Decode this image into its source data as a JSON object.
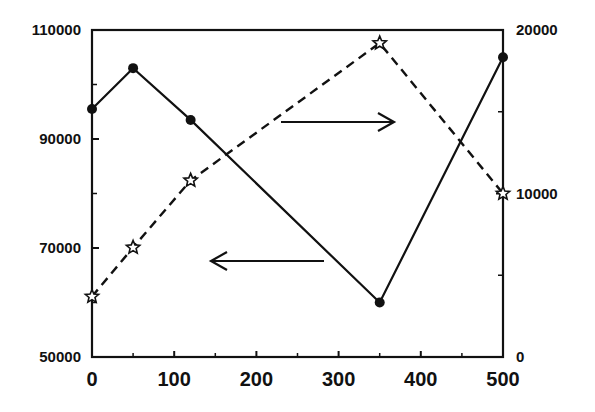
{
  "chart_data": {
    "type": "line",
    "title": "",
    "xlabel": "",
    "ylabel": "",
    "y2label": "",
    "xlim": [
      0,
      500
    ],
    "ylim": [
      50000,
      110000
    ],
    "y2lim": [
      0,
      20000
    ],
    "x_ticks": [
      0,
      100,
      200,
      300,
      400,
      500
    ],
    "y_ticks": [
      50000,
      70000,
      90000,
      110000
    ],
    "y2_ticks": [
      0,
      10000,
      20000
    ],
    "x_tick_labels": [
      "0",
      "100",
      "200",
      "300",
      "400",
      "500"
    ],
    "y_tick_labels": [
      "50000",
      "70000",
      "90000",
      "110000"
    ],
    "y2_tick_labels": [
      "0",
      "10000",
      "20000"
    ],
    "grid": false,
    "legend": null,
    "series": [
      {
        "name": "left-axis series (solid, filled circles)",
        "axis": "left",
        "line_style": "solid",
        "marker": "filled-circle",
        "x": [
          0,
          50,
          120,
          350,
          500
        ],
        "values": [
          95500,
          103000,
          93500,
          60000,
          105000
        ]
      },
      {
        "name": "right-axis series (dashed, open stars)",
        "axis": "right",
        "line_style": "dashed",
        "marker": "open-star",
        "x": [
          0,
          50,
          120,
          350,
          500
        ],
        "values": [
          3700,
          6700,
          10800,
          19200,
          10000
        ]
      }
    ],
    "annotations": [
      {
        "type": "arrow",
        "direction": "right",
        "note": "points to right axis (dashed series)"
      },
      {
        "type": "arrow",
        "direction": "left",
        "note": "points to left axis (solid series)"
      }
    ]
  }
}
